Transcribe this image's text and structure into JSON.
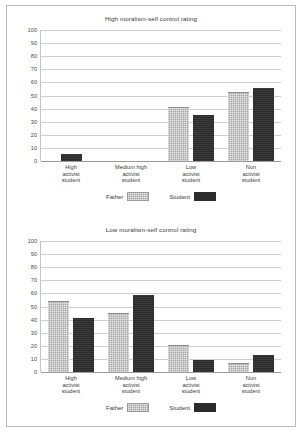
{
  "figure": {
    "legend": {
      "father_label": "Father",
      "student_label": "Student"
    },
    "colors": {
      "father": "#a8a8a8",
      "student": "#2b2b2b",
      "gridline": "#cfcfcf",
      "frame": "#b9b9b9",
      "text": "#3c3c3c"
    },
    "yticks": [
      "100",
      "90",
      "80",
      "70",
      "60",
      "50",
      "40",
      "30",
      "20",
      "10",
      "0"
    ]
  },
  "chart_data": [
    {
      "type": "bar",
      "title": "High moralism-self control rating",
      "xlabel": "",
      "ylabel": "",
      "ylim": [
        0,
        100
      ],
      "ytick_values": [
        0,
        10,
        20,
        30,
        40,
        50,
        60,
        70,
        80,
        90,
        100
      ],
      "grid": true,
      "legend_position": "bottom",
      "categories": [
        "High activist student",
        "Medium high activist student",
        "Low activist student",
        "Non activist student"
      ],
      "category_lines": [
        [
          "High",
          "activist",
          "student"
        ],
        [
          "Medium high",
          "activist",
          "student"
        ],
        [
          "Low",
          "activist",
          "student"
        ],
        [
          "Non",
          "activist",
          "student"
        ]
      ],
      "series": [
        {
          "name": "Father",
          "values": [
            0,
            0,
            41,
            53
          ]
        },
        {
          "name": "Student",
          "values": [
            5,
            0,
            35,
            56
          ]
        }
      ]
    },
    {
      "type": "bar",
      "title": "Low moralism-self control rating",
      "xlabel": "",
      "ylabel": "",
      "ylim": [
        0,
        100
      ],
      "ytick_values": [
        0,
        10,
        20,
        30,
        40,
        50,
        60,
        70,
        80,
        90,
        100
      ],
      "grid": true,
      "legend_position": "bottom",
      "categories": [
        "High activist student",
        "Medium high activist student",
        "Low activist student",
        "Non activist student"
      ],
      "category_lines": [
        [
          "High",
          "activist",
          "student"
        ],
        [
          "Medium high",
          "activist",
          "student"
        ],
        [
          "Low",
          "activist",
          "student"
        ],
        [
          "Non",
          "activist",
          "student"
        ]
      ],
      "series": [
        {
          "name": "Father",
          "values": [
            54,
            45,
            21,
            7
          ]
        },
        {
          "name": "Student",
          "values": [
            41,
            59,
            9,
            13
          ]
        }
      ]
    }
  ]
}
